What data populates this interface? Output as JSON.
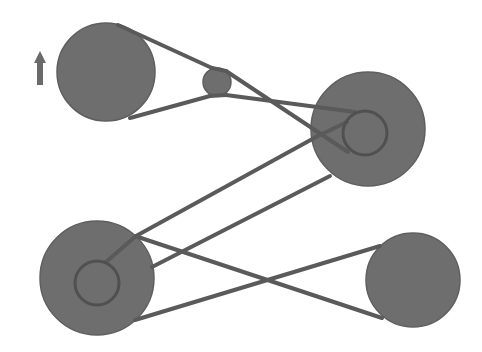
{
  "diagram": {
    "title": "Belt and pulley drive system",
    "width": 482,
    "height": 352,
    "colors": {
      "background": "#ffffff",
      "pulley_fill": "#6e6e6e",
      "belt": "#5a5a5a",
      "hub": "#505050",
      "arrow": "#6a6a6a"
    },
    "direction_arrow": {
      "name": "rotation-direction-arrow",
      "direction": "up",
      "x": 40,
      "y_top": 51,
      "y_bottom": 85
    },
    "pulleys": [
      {
        "id": "drive-pulley-top-left",
        "cx": 106,
        "cy": 72,
        "r": 49
      },
      {
        "id": "idler-pulley",
        "cx": 217,
        "cy": 82,
        "r": 14
      },
      {
        "id": "compound-pulley-top-right",
        "cx": 368,
        "cy": 129,
        "r": 57,
        "hub": {
          "cx": 365,
          "cy": 133,
          "r": 22
        }
      },
      {
        "id": "compound-pulley-bottom-left",
        "cx": 97,
        "cy": 278,
        "r": 57,
        "hub": {
          "cx": 97,
          "cy": 283,
          "r": 22
        }
      },
      {
        "id": "driven-pulley-bottom-right",
        "cx": 413,
        "cy": 280,
        "r": 47
      }
    ],
    "belts": [
      {
        "id": "belt-1-crossed",
        "description": "Crossed belt from top-left drive pulley around idler to top-right pulley hub",
        "segments": [
          {
            "x1": 118,
            "y1": 25,
            "x2": 212,
            "y2": 68
          },
          {
            "x1": 212,
            "y1": 68,
            "x2": 226,
            "y2": 71
          },
          {
            "x1": 226,
            "y1": 71,
            "x2": 348,
            "y2": 152
          },
          {
            "x1": 130,
            "y1": 118,
            "x2": 210,
            "y2": 96
          },
          {
            "x1": 210,
            "y1": 96,
            "x2": 226,
            "y2": 95
          },
          {
            "x1": 226,
            "y1": 95,
            "x2": 355,
            "y2": 112
          }
        ],
        "hub_wrap": {
          "cx": 365,
          "cy": 133,
          "r": 22
        }
      },
      {
        "id": "belt-2-open",
        "description": "Open belt from bottom-left compound pulley rim to top-right compound pulley rim",
        "segments": [
          {
            "x1": 136,
            "y1": 236,
            "x2": 316,
            "y2": 137
          },
          {
            "x1": 152,
            "y1": 267,
            "x2": 330,
            "y2": 176
          }
        ]
      },
      {
        "id": "belt-3-hub-open",
        "description": "Open belt between top-right hub and bottom-left hub",
        "segments": [
          {
            "x1": 316,
            "y1": 137,
            "x2": 347,
            "y2": 122
          },
          {
            "x1": 106,
            "y1": 262,
            "x2": 136,
            "y2": 236
          }
        ]
      },
      {
        "id": "belt-4-crossed",
        "description": "Crossed belt from bottom-left compound pulley to bottom-right driven pulley",
        "segments": [
          {
            "x1": 138,
            "y1": 237,
            "x2": 382,
            "y2": 318
          },
          {
            "x1": 135,
            "y1": 320,
            "x2": 380,
            "y2": 246
          }
        ]
      }
    ]
  }
}
